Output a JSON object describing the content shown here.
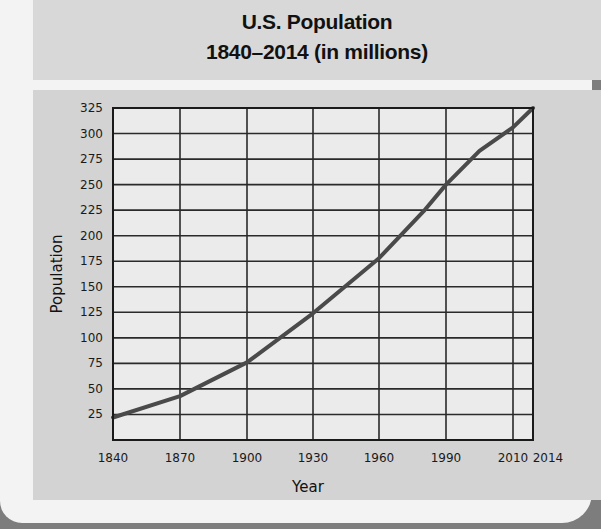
{
  "title": {
    "line1": "U.S. Population",
    "line2": "1840–2014 (in millions)"
  },
  "colors": {
    "page_bg": "#7d7d7d",
    "card": "#f3f3f3",
    "title_panel": "#d8d8d8",
    "chart_panel": "#d3d3d3",
    "plot_bg": "#ebebeb",
    "grid": "#2a2a2a",
    "line": "#4a4a4a"
  },
  "chart_data": {
    "type": "line",
    "title": "U.S. Population 1840–2014 (in millions)",
    "xlabel": "Year",
    "ylabel": "Population",
    "x_tick_labels": [
      "1840",
      "1870",
      "1900",
      "1930",
      "1960",
      "1990",
      "2010",
      "2014"
    ],
    "y_tick_labels": [
      "25",
      "50",
      "75",
      "100",
      "125",
      "150",
      "175",
      "200",
      "225",
      "250",
      "275",
      "300",
      "325"
    ],
    "ylim": [
      0,
      325
    ],
    "grid": true,
    "legend": null,
    "series": [
      {
        "name": "U.S. Population",
        "x": [
          1840,
          1870,
          1900,
          1930,
          1960,
          1980,
          1990,
          2000,
          2010,
          2014
        ],
        "values": [
          22,
          43,
          76,
          124,
          178,
          224,
          250,
          283,
          306,
          325
        ]
      }
    ]
  }
}
